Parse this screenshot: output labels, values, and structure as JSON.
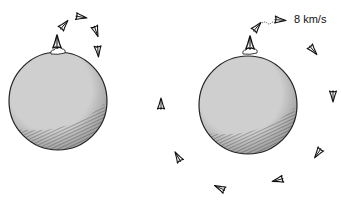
{
  "figure": {
    "colors": {
      "planet_fill": "#c9c9c9",
      "outline": "#222222",
      "background": "#ffffff"
    },
    "left_panel": {
      "planet": {
        "cx": 58,
        "cy": 101,
        "r": 49
      },
      "launch_cloud": {
        "x": 58,
        "y": 52
      },
      "launch_rocket": {
        "x": 57,
        "y": 42,
        "angle": 0
      },
      "trajectory_rockets": [
        {
          "x": 64,
          "y": 25,
          "angle": 40
        },
        {
          "x": 81,
          "y": 17,
          "angle": 100
        },
        {
          "x": 96,
          "y": 31,
          "angle": 160
        },
        {
          "x": 98,
          "y": 51,
          "angle": 175
        }
      ]
    },
    "right_panel": {
      "planet": {
        "cx": 248,
        "cy": 105,
        "r": 49
      },
      "launch_cloud": {
        "x": 250,
        "y": 52
      },
      "launch_rocket": {
        "x": 250,
        "y": 43,
        "angle": 0
      },
      "orbit_rockets": [
        {
          "x": 257,
          "y": 27,
          "angle": 40
        },
        {
          "x": 280,
          "y": 20,
          "angle": 95
        },
        {
          "x": 313,
          "y": 50,
          "angle": 140
        },
        {
          "x": 333,
          "y": 96,
          "angle": 180
        },
        {
          "x": 318,
          "y": 153,
          "angle": 215
        },
        {
          "x": 278,
          "y": 180,
          "angle": 255
        },
        {
          "x": 220,
          "y": 188,
          "angle": 295
        },
        {
          "x": 178,
          "y": 157,
          "angle": 330
        },
        {
          "x": 161,
          "y": 104,
          "angle": 0
        }
      ],
      "speed_label": "8 km/s"
    }
  }
}
